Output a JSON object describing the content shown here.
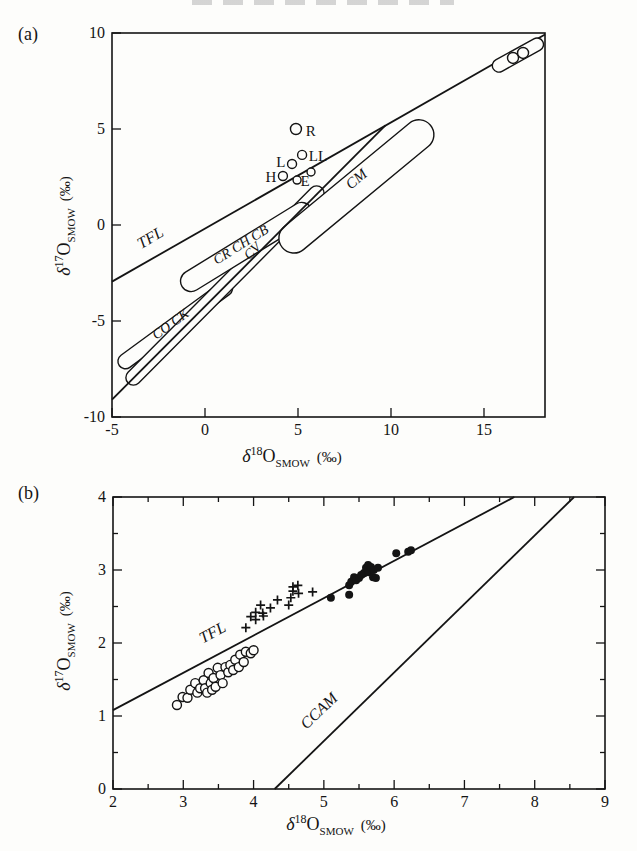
{
  "page": {
    "panel_a_label": "(a)",
    "panel_b_label": "(b)",
    "ink_color": "#141414",
    "background": "#fdfdfb",
    "cropped_header_remnant": true
  },
  "chart_data": [
    {
      "id": "a",
      "type": "scatter",
      "xlabel_parts": {
        "delta": "δ",
        "sup": "18",
        "element": "O",
        "sub": "SMOW",
        "units": "(‰)"
      },
      "ylabel_parts": {
        "delta": "δ",
        "sup": "17",
        "element": "O",
        "sub": "SMOW",
        "units": "(‰)"
      },
      "xlim": [
        -5,
        18.28
      ],
      "ylim": [
        -10,
        10
      ],
      "xticks": [
        -5,
        0,
        5,
        10,
        15
      ],
      "yticks": [
        -10,
        -5,
        0,
        5,
        10
      ],
      "minor_xticks": [],
      "minor_yticks": [],
      "tick_sides": [
        "bottom",
        "left"
      ],
      "grid": false,
      "frame_px": {
        "left": 112,
        "right": 545,
        "top": 33,
        "bottom": 417
      },
      "xlabel_px": {
        "x": 292,
        "y": 462
      },
      "ylabel_px": {
        "x": 70,
        "y": 226
      },
      "lines": [
        {
          "name": "TFL",
          "x1": -5,
          "y1": -2.95,
          "x2": 18.28,
          "y2": 9.92,
          "label": {
            "text": "TFL",
            "x": -2.8,
            "y": -0.9,
            "rot": -30,
            "fs": 16
          }
        },
        {
          "name": "CCAM",
          "x1": -5,
          "y1": -9.1,
          "x2": 9.7,
          "y2": 5.19
        }
      ],
      "capsules": [
        {
          "name": "CO CK",
          "x1": -4.28,
          "y1": -7.1,
          "x2": 1.08,
          "y2": -3.3,
          "width": 15,
          "label": {
            "text": "CO CK",
            "x": -1.72,
            "y": -5.35,
            "rot": -36,
            "fs": 14
          }
        },
        {
          "name": "CV",
          "x1": -3.85,
          "y1": -7.95,
          "x2": 6.0,
          "y2": 1.65,
          "width": 15,
          "label": {
            "text": "CV",
            "x": 2.72,
            "y": -1.52,
            "rot": -45,
            "fs": 14
          }
        },
        {
          "name": "CR CH CB",
          "x1": -0.75,
          "y1": -2.92,
          "x2": 5.2,
          "y2": 0.63,
          "width": 21,
          "label": {
            "text": "CR CH CB",
            "x": 2.05,
            "y": -1.22,
            "rot": -32,
            "fs": 14
          }
        },
        {
          "name": "CM",
          "x1": 4.78,
          "y1": -0.68,
          "x2": 11.5,
          "y2": 4.7,
          "width": 30,
          "label": {
            "text": "CM",
            "x": 8.3,
            "y": 2.2,
            "rot": -40,
            "fs": 15
          }
        },
        {
          "name": "CI",
          "x1": 15.8,
          "y1": 8.3,
          "x2": 17.85,
          "y2": 9.4,
          "width": 13,
          "over_lines": true
        }
      ],
      "circles": [
        {
          "x": 4.89,
          "y": 5.0,
          "r": 5.5,
          "label": "R",
          "lx": 5.42,
          "ly": 4.9,
          "anchor": "start"
        },
        {
          "x": 5.22,
          "y": 3.65,
          "r": 4.5,
          "label": "LL",
          "lx": 5.58,
          "ly": 3.58,
          "anchor": "start"
        },
        {
          "x": 4.68,
          "y": 3.18,
          "r": 4.5,
          "label": "L",
          "lx": 4.32,
          "ly": 3.26,
          "anchor": "end"
        },
        {
          "x": 4.19,
          "y": 2.55,
          "r": 4.5,
          "label": "H",
          "lx": 3.83,
          "ly": 2.5,
          "anchor": "end"
        },
        {
          "x": 4.95,
          "y": 2.34,
          "r": 4.0
        },
        {
          "x": 5.7,
          "y": 2.76,
          "r": 4.0,
          "label": "E",
          "lx": 5.38,
          "ly": 2.28,
          "anchor": "middle"
        },
        {
          "x": 16.56,
          "y": 8.7,
          "r": 5.5
        },
        {
          "x": 17.1,
          "y": 8.96,
          "r": 5.5
        }
      ]
    },
    {
      "id": "b",
      "type": "scatter",
      "xlabel_parts": {
        "delta": "δ",
        "sup": "18",
        "element": "O",
        "sub": "SMOW",
        "units": "(‰)"
      },
      "ylabel_parts": {
        "delta": "δ",
        "sup": "17",
        "element": "O",
        "sub": "SMOW",
        "units": "(‰)"
      },
      "xlim": [
        2,
        9
      ],
      "ylim": [
        0,
        4
      ],
      "xticks": [
        2,
        3,
        4,
        5,
        6,
        7,
        8,
        9
      ],
      "yticks": [
        0,
        1,
        2,
        3,
        4
      ],
      "minor_xticks": [
        2.5,
        3.5,
        4.5,
        5.5,
        6.5,
        7.5,
        8.5
      ],
      "minor_yticks": [
        0.5,
        1.5,
        2.5,
        3.5
      ],
      "tick_sides": [
        "bottom",
        "left",
        "top",
        "right"
      ],
      "grid": false,
      "frame_px": {
        "left": 113,
        "right": 605,
        "top": 497,
        "bottom": 789
      },
      "xlabel_px": {
        "x": 336,
        "y": 830
      },
      "ylabel_px": {
        "x": 70,
        "y": 641
      },
      "lines": [
        {
          "name": "TFL",
          "x1": 2,
          "y1": 1.08,
          "x2": 7.71,
          "y2": 4.0,
          "label": {
            "text": "TFL",
            "x": 3.45,
            "y": 2.08,
            "rot": -28,
            "fs": 16
          }
        },
        {
          "name": "CCAM",
          "x1": 4.3,
          "y1": 0,
          "x2": 8.56,
          "y2": 4.0,
          "label": {
            "text": "CCAM",
            "x": 4.98,
            "y": 1.02,
            "rot": -44,
            "fs": 16
          }
        }
      ],
      "series": [
        {
          "name": "open-circles",
          "marker": "open-circle",
          "points": [
            [
              2.91,
              1.15
            ],
            [
              2.99,
              1.26
            ],
            [
              3.06,
              1.25
            ],
            [
              3.1,
              1.36
            ],
            [
              3.17,
              1.45
            ],
            [
              3.2,
              1.32
            ],
            [
              3.24,
              1.38
            ],
            [
              3.29,
              1.49
            ],
            [
              3.31,
              1.38
            ],
            [
              3.34,
              1.32
            ],
            [
              3.36,
              1.59
            ],
            [
              3.39,
              1.45
            ],
            [
              3.41,
              1.36
            ],
            [
              3.43,
              1.52
            ],
            [
              3.46,
              1.4
            ],
            [
              3.49,
              1.66
            ],
            [
              3.53,
              1.56
            ],
            [
              3.56,
              1.45
            ],
            [
              3.6,
              1.67
            ],
            [
              3.64,
              1.6
            ],
            [
              3.67,
              1.7
            ],
            [
              3.71,
              1.63
            ],
            [
              3.74,
              1.77
            ],
            [
              3.79,
              1.67
            ],
            [
              3.81,
              1.84
            ],
            [
              3.86,
              1.74
            ],
            [
              3.89,
              1.88
            ],
            [
              3.96,
              1.86
            ],
            [
              4.0,
              1.9
            ]
          ]
        },
        {
          "name": "plus-marks",
          "marker": "plus",
          "points": [
            [
              3.89,
              2.21
            ],
            [
              3.96,
              2.36
            ],
            [
              4.03,
              2.42
            ],
            [
              4.03,
              2.32
            ],
            [
              4.1,
              2.52
            ],
            [
              4.13,
              2.41
            ],
            [
              4.14,
              2.37
            ],
            [
              4.24,
              2.48
            ],
            [
              4.34,
              2.59
            ],
            [
              4.5,
              2.52
            ],
            [
              4.53,
              2.62
            ],
            [
              4.56,
              2.77
            ],
            [
              4.56,
              2.71
            ],
            [
              4.63,
              2.79
            ],
            [
              4.64,
              2.68
            ],
            [
              4.84,
              2.7
            ]
          ]
        },
        {
          "name": "filled-circles",
          "marker": "filled-circle",
          "points": [
            [
              5.1,
              2.62
            ],
            [
              5.36,
              2.66
            ],
            [
              5.36,
              2.79
            ],
            [
              5.39,
              2.84
            ],
            [
              5.43,
              2.9
            ],
            [
              5.46,
              2.86
            ],
            [
              5.5,
              2.89
            ],
            [
              5.53,
              2.93
            ],
            [
              5.57,
              2.96
            ],
            [
              5.6,
              3.03
            ],
            [
              5.63,
              3.07
            ],
            [
              5.64,
              2.97
            ],
            [
              5.67,
              3.04
            ],
            [
              5.7,
              2.9
            ],
            [
              5.71,
              3.0
            ],
            [
              5.74,
              2.89
            ],
            [
              5.77,
              3.03
            ],
            [
              6.03,
              3.23
            ],
            [
              6.2,
              3.25
            ],
            [
              6.24,
              3.27
            ]
          ]
        }
      ]
    }
  ]
}
